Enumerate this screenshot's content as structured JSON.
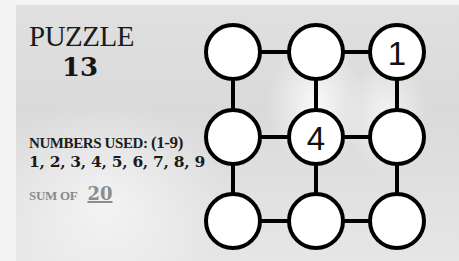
{
  "puzzle": {
    "title": "PUZZLE",
    "number": "13"
  },
  "rules": {
    "numbers_used_label": "NUMBERS USED:",
    "range": "(1-9)",
    "values": "1, 2, 3, 4, 5, 6, 7, 8, 9",
    "sum_label": "SUM OF",
    "sum_value": "20"
  },
  "grid": {
    "rows": 3,
    "cols": 3,
    "cells": [
      [
        "",
        "",
        "1"
      ],
      [
        "",
        "4",
        ""
      ],
      [
        "",
        "",
        ""
      ]
    ]
  },
  "colors": {
    "stroke": "#000000",
    "cell_fill": "#ffffff",
    "sum_gray": "#8a8a8a"
  }
}
